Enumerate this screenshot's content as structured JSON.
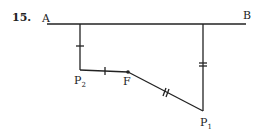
{
  "problem_number": "15.",
  "labels": {
    "A": "A",
    "B": "B",
    "P2": "P",
    "P2_sub": "2",
    "F": "F",
    "P1": "P",
    "P1_sub": "1"
  },
  "colors": {
    "line": "#222222",
    "background": "#ffffff"
  }
}
